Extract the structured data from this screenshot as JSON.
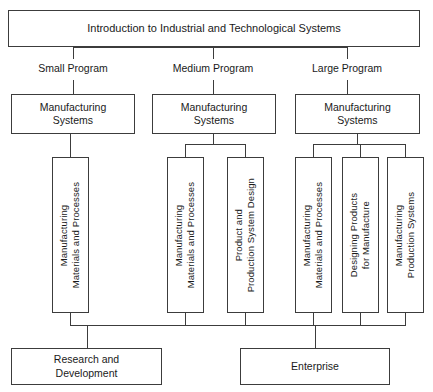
{
  "diagram": {
    "title": "Introduction to Industrial and Technological Systems",
    "root": {
      "label": "Introduction to Industrial and Technological Systems"
    },
    "branches": [
      {
        "id": "small",
        "program_label": "Small Program",
        "systems_label": "Manufacturing\nSystems",
        "courses": [
          {
            "label": "Manufacturing\nMaterials and Processes"
          }
        ]
      },
      {
        "id": "medium",
        "program_label": "Medium Program",
        "systems_label": "Manufacturing\nSystems",
        "courses": [
          {
            "label": "Manufacturing\nMaterials and Processes"
          },
          {
            "label": "Product and\nProduction System Design"
          }
        ]
      },
      {
        "id": "large",
        "program_label": "Large Program",
        "systems_label": "Manufacturing\nSystems",
        "courses": [
          {
            "label": "Manufacturing\nMaterials and Processes"
          },
          {
            "label": "Designing Products\nfor Manufacture"
          },
          {
            "label": "Manufacturing\nProduction Systems"
          }
        ]
      }
    ],
    "outcomes": [
      {
        "id": "research-and-development",
        "label": "Research and\nDevelopment"
      },
      {
        "id": "enterprise",
        "label": "Enterprise"
      }
    ],
    "colors": {
      "stroke": "#3c3c3c",
      "text": "#1a1a1a",
      "background": "#ffffff"
    }
  }
}
